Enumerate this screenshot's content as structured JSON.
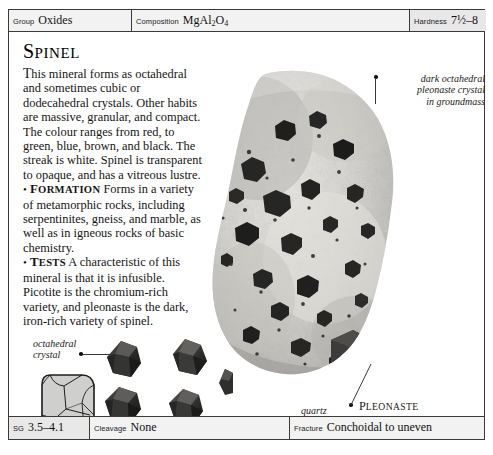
{
  "header": {
    "group": {
      "label": "Group",
      "value": "Oxides"
    },
    "composition": {
      "label": "Composition",
      "value_main1": "MgAl",
      "value_sub1": "2",
      "value_main2": "O",
      "value_sub2": "4"
    },
    "hardness": {
      "label": "Hardness",
      "value": "7½–8"
    }
  },
  "article": {
    "title_first": "S",
    "title_rest": "PINEL",
    "intro": "his mineral forms as octahedral and sometimes cubic or dodecahedral crystals. Other habits are massive, granular, and compact. The colour ranges from red, to green, blue, brown, and black. The streak is white. Spinel is transparent to opaque, and has a vitreous lustre.",
    "intro_dropin": "T",
    "formation": {
      "bullet": "•",
      "heading_first": "F",
      "heading_rest": "ORMATION",
      "text": "Forms in a variety of metamorphic rocks, including serpentinites, gneiss, and marble, as well as in igneous rocks of basic chemistry."
    },
    "tests": {
      "bullet": "•",
      "heading_first": "T",
      "heading_rest": "ESTS",
      "text": "A characteristic of this mineral is that it is infusible. Picotite is the chromium-rich variety, and pleonaste is the dark, iron-rich variety of spinel."
    }
  },
  "annotations": {
    "dark_crystal": "dark octahedral\npleonaste crystal\nin groundmass",
    "octahedral_crystal": "octahedral\ncrystal",
    "quartz_groundmass": "quartz\ngroundmass",
    "pleonaste_first": "P",
    "pleonaste_rest": "LEONASTE",
    "ruby_first": "R",
    "ruby_rest": "UBY ",
    "ruby_first2": "S",
    "ruby_rest2": "PINEL",
    "cubic_caption": "CUBIC"
  },
  "footer": {
    "sg": {
      "label": "SG",
      "value": "3.5–4.1"
    },
    "cleavage": {
      "label": "Cleavage",
      "value": "None"
    },
    "fracture": {
      "label": "Fracture",
      "value": "Conchoidal to uneven"
    }
  },
  "colors": {
    "border": "#3a3a3a",
    "bar_fill": "#f2f2f2",
    "bar_fill_alt": "#e8e8e8",
    "text": "#141414",
    "crystal_dark": "#2a2a2a",
    "groundmass_light": "#d8d8d4"
  }
}
